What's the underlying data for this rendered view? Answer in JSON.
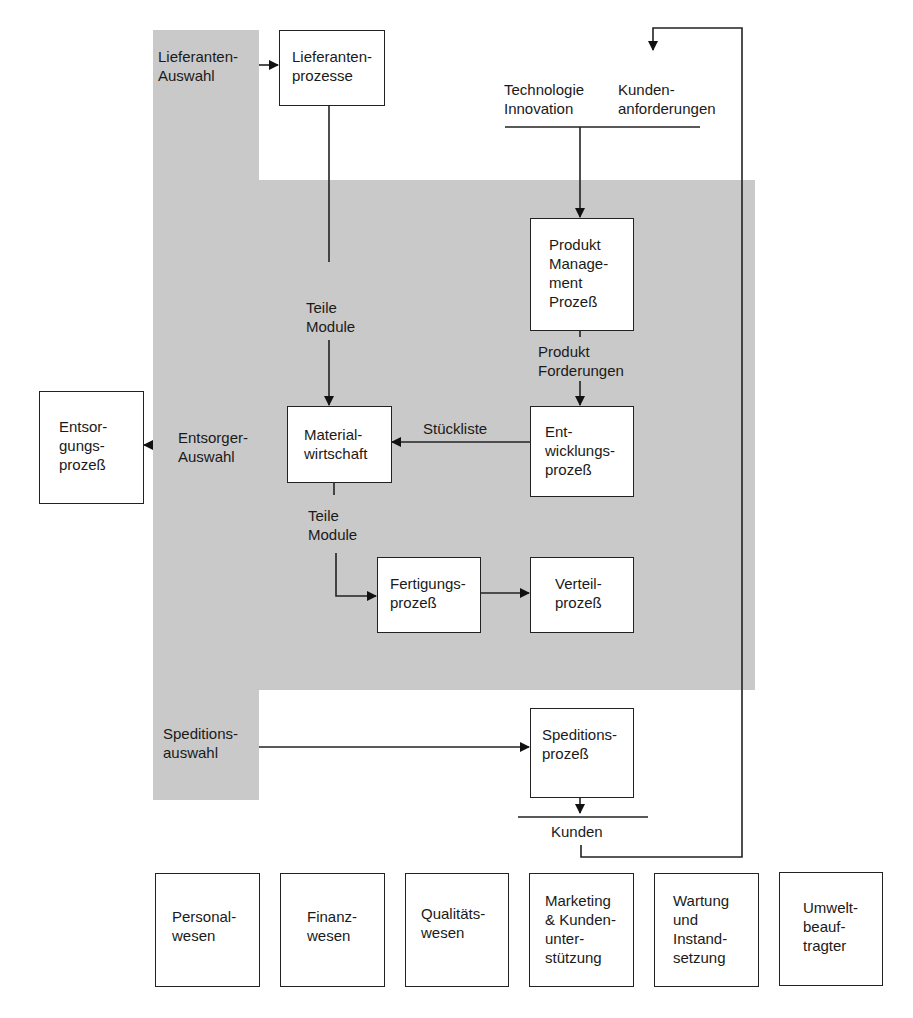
{
  "diagram": {
    "boxes": {
      "lieferantenprozesse": "Lieferanten-\nprozesse",
      "produkt_management": "Produkt\nManage-\nment\nProzeß",
      "entwicklungsprozess": "Ent-\nwicklungs-\nprozeß",
      "materialwirtschaft": "Material-\nwirtschaft",
      "entsorgungsprozess": "Entsor-\ngungs-\nprozeß",
      "fertigungsprozess": "Fertigungs-\nprozeß",
      "verteilprozess": "Verteil-\nprozeß",
      "speditionsprozess": "Speditions-\nprozeß"
    },
    "labels": {
      "lieferanten_auswahl": "Lieferanten-\nAuswahl",
      "technologie_innovation": "Technologie\nInnovation",
      "kundenanforderungen": "Kunden-\nanforderungen",
      "teile_module_top": "Teile\nModule",
      "produkt_forderungen": "Produkt\nForderungen",
      "stueckliste": "Stückliste",
      "entsorger_auswahl": "Entsorger-\nAuswahl",
      "teile_module_bottom": "Teile\nModule",
      "speditionsauswahl": "Speditions-\nauswahl",
      "kunden": "Kunden"
    },
    "support_functions": [
      "Personal-\nwesen",
      "Finanz-\nwesen",
      "Qualitäts-\nwesen",
      "Marketing\n& Kunden-\nunter-\nstützung",
      "Wartung\nund\nInstand-\nsetzung",
      "Umwelt-\nbeauf-\ntragter"
    ]
  }
}
